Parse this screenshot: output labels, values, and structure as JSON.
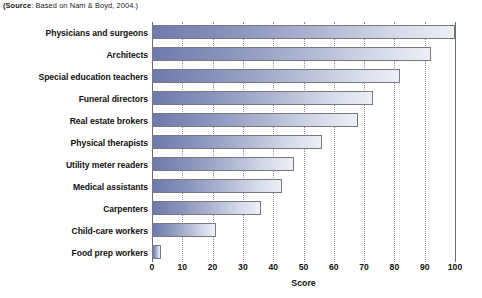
{
  "source_note": {
    "bold_prefix": "(Source",
    "rest": ": Based on Nam & Boyd, 2004.)"
  },
  "chart_data": {
    "type": "bar",
    "orientation": "horizontal",
    "title": "",
    "subtitle": "",
    "xlabel": "Score",
    "ylabel": "",
    "xlim": [
      0,
      100
    ],
    "xticks": [
      0,
      10,
      20,
      30,
      40,
      50,
      60,
      70,
      80,
      90,
      100
    ],
    "xtick_labels": [
      "0",
      "10",
      "20",
      "30",
      "40",
      "50",
      "60",
      "70",
      "80",
      "90",
      "100"
    ],
    "grid": true,
    "grid_axis": "x",
    "grid_style": "dotted",
    "legend": false,
    "legend_position": "none",
    "categories": [
      "Physicians and surgeons",
      "Architects",
      "Special education teachers",
      "Funeral directors",
      "Real estate brokers",
      "Physical therapists",
      "Utility meter readers",
      "Medical assistants",
      "Carpenters",
      "Child-care workers",
      "Food prep workers"
    ],
    "values": [
      100,
      92,
      82,
      73,
      68,
      56,
      47,
      43,
      36,
      21,
      3
    ],
    "bar_gradient_from": "#6d7aab",
    "bar_gradient_to": "#eceff6",
    "bar_border_color": "#77797d",
    "gridline_color": "#8d8d8d",
    "axis_color": "#6d6d6d",
    "background": "#ffffff"
  }
}
